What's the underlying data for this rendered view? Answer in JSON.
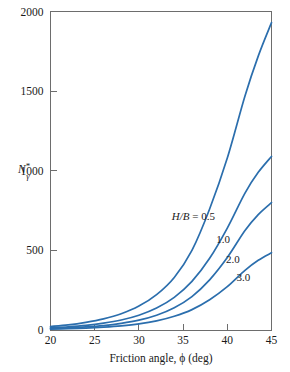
{
  "chart_data": {
    "type": "line",
    "title": "",
    "xlabel": "Friction angle, ϕ (deg)",
    "ylabel": "N*γ",
    "ylabel_base": "N",
    "ylabel_sup": "*",
    "ylabel_sub": "γ",
    "xlim": [
      20,
      45
    ],
    "ylim": [
      0,
      2000
    ],
    "xticks": [
      20,
      25,
      30,
      35,
      40,
      45
    ],
    "yticks": [
      0,
      500,
      1000,
      1500,
      2000
    ],
    "xtick_labels": [
      "20",
      "25",
      "30",
      "35",
      "40",
      "45"
    ],
    "ytick_labels": [
      "0",
      "500",
      "1000",
      "1500",
      "2000"
    ],
    "grid": false,
    "legend_position": "inline-annotations",
    "series_group_label": "H/B =",
    "line_color": "#2b6ead",
    "series": [
      {
        "name": "H/B = 0.5",
        "label": "0.5",
        "label_prefix": "H/B =",
        "x": [
          20,
          22,
          24,
          26,
          28,
          30,
          32,
          34,
          36,
          38,
          40,
          42,
          43.5,
          45
        ],
        "values": [
          22,
          32,
          48,
          70,
          102,
          150,
          222,
          330,
          500,
          760,
          1080,
          1470,
          1720,
          1930
        ]
      },
      {
        "name": "H/B = 1.0",
        "label": "1.0",
        "x": [
          20,
          22,
          24,
          26,
          28,
          30,
          32,
          34,
          36,
          38,
          40,
          42,
          43.5,
          45
        ],
        "values": [
          14,
          20,
          29,
          43,
          63,
          93,
          138,
          205,
          305,
          450,
          640,
          860,
          990,
          1090
        ]
      },
      {
        "name": "H/B = 2.0",
        "label": "2.0",
        "x": [
          20,
          22,
          24,
          26,
          28,
          30,
          32,
          34,
          36,
          38,
          40,
          42,
          43.5,
          45
        ],
        "values": [
          9,
          13,
          19,
          28,
          42,
          62,
          93,
          140,
          210,
          315,
          455,
          625,
          725,
          800
        ]
      },
      {
        "name": "H/B = 3.0",
        "label": "3.0",
        "x": [
          20,
          22,
          24,
          26,
          28,
          30,
          32,
          34,
          36,
          38,
          40,
          42,
          43.5,
          45
        ],
        "values": [
          5,
          8,
          12,
          18,
          26,
          38,
          57,
          86,
          128,
          190,
          272,
          375,
          438,
          485
        ]
      }
    ],
    "annotations": [
      {
        "text": "H/B = 0.5",
        "x": 38.6,
        "y": 690
      },
      {
        "text": "1.0",
        "x": 40.3,
        "y": 545
      },
      {
        "text": "2.0",
        "x": 41.4,
        "y": 420
      },
      {
        "text": "3.0",
        "x": 42.6,
        "y": 305
      }
    ]
  }
}
